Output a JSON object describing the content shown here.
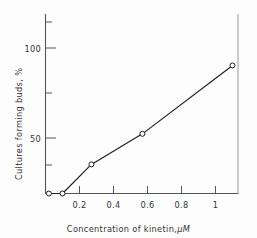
{
  "chart_data": {
    "type": "line",
    "title": "",
    "xlabel": "Concentration of kinetin, μM",
    "ylabel": "Cultures forming buds, %",
    "xlabel_text": "Concentration of kinetin,",
    "xlabel_unit": "μM",
    "xlim": [
      0.0,
      1.17
    ],
    "ylim": [
      0,
      128
    ],
    "grid": false,
    "legend": null,
    "marker": "open-circle",
    "line_color": "#1d1d1d",
    "axis_color": "#4a4a4a",
    "x": [
      0.02,
      0.1,
      0.27,
      0.57,
      1.1
    ],
    "y": [
      0,
      0,
      20,
      41,
      88
    ],
    "points": [
      {
        "x": 0.02,
        "y": 0
      },
      {
        "x": 0.1,
        "y": 0
      },
      {
        "x": 0.27,
        "y": 20
      },
      {
        "x": 0.57,
        "y": 41
      },
      {
        "x": 1.1,
        "y": 88
      }
    ],
    "xticks": [
      0.2,
      0.4,
      0.6,
      0.8,
      1.0
    ],
    "xticklabels": [
      "0.2",
      "0.4",
      "0.6",
      "0.8",
      "1"
    ],
    "yticks": [
      25,
      50,
      75,
      100,
      125
    ],
    "yticklabels": [
      "",
      "50",
      "",
      "100",
      ""
    ],
    "ylabeled_ticks": [
      {
        "value": 50,
        "label": "50"
      },
      {
        "value": 100,
        "label": "100"
      }
    ],
    "spines": {
      "left": true,
      "bottom": true,
      "right": true,
      "top": false
    }
  }
}
